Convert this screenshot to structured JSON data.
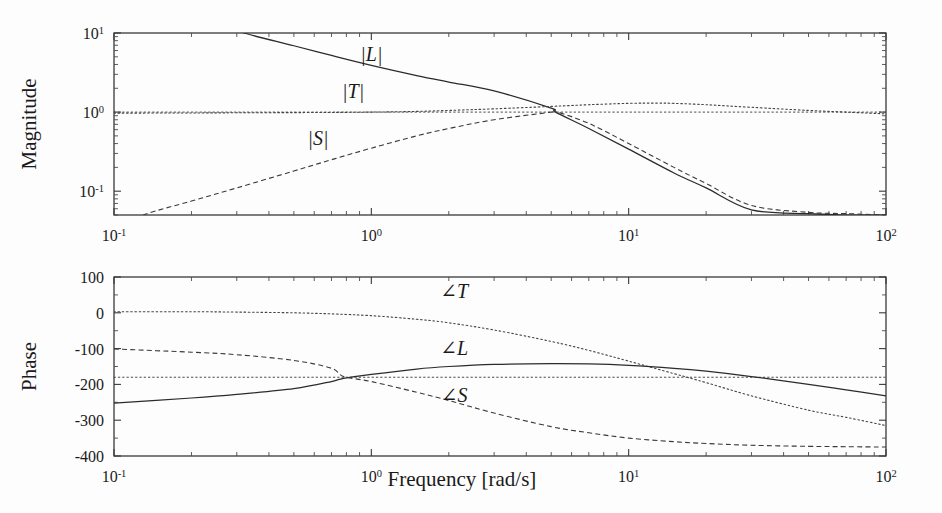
{
  "figure": {
    "type": "bode-plot",
    "background": "#fdfdfd",
    "ink_color": "#2b2b2b"
  },
  "xaxis": {
    "label": "Frequency [rad/s]",
    "scale": "log",
    "min": 0.1,
    "max": 100,
    "tick_values": [
      0.1,
      1,
      10,
      100
    ],
    "tick_labels": [
      "10",
      "10",
      "10",
      "10"
    ],
    "tick_exponents": [
      "-1",
      "0",
      "1",
      "2"
    ]
  },
  "magnitude_plot": {
    "ylabel": "Magnitude",
    "yscale": "log",
    "ymin": 0.05,
    "ymax": 10,
    "ytick_labels": [
      "10",
      "10",
      "10"
    ],
    "ytick_exponents": [
      "1",
      "0",
      "-1"
    ],
    "ytick_values": [
      10,
      1,
      0.1
    ],
    "curve_labels": [
      {
        "id": "L",
        "text": "|L|",
        "x": 1.0,
        "y": 4.4
      },
      {
        "id": "T",
        "text": "|T|",
        "x": 0.85,
        "y": 1.5
      },
      {
        "id": "S",
        "text": "|S|",
        "x": 0.62,
        "y": 0.38
      }
    ],
    "reference_line": {
      "value": 1.0,
      "style": "dotted"
    }
  },
  "phase_plot": {
    "ylabel": "Phase",
    "yscale": "linear",
    "ymin": -400,
    "ymax": 100,
    "ytick_values": [
      100,
      0,
      -100,
      -200,
      -300,
      -400
    ],
    "ytick_labels": [
      "100",
      "0",
      "-100",
      "-200",
      "-300",
      "-400"
    ],
    "curve_labels": [
      {
        "id": "T",
        "text": "∠T",
        "x": 2.1,
        "y": 42
      },
      {
        "id": "L",
        "text": "∠L",
        "x": 2.1,
        "y": -118
      },
      {
        "id": "S",
        "text": "∠S",
        "x": 2.1,
        "y": -248
      }
    ],
    "reference_line": {
      "value": -180,
      "style": "dotted"
    }
  },
  "chart_data": {
    "type": "line",
    "title": "",
    "subtitle": "",
    "xlabel": "Frequency [rad/s]",
    "xscale": "log",
    "xlim": [
      0.1,
      100
    ],
    "xticks": [
      0.1,
      1,
      10,
      100
    ],
    "xticklabels": [
      "10^-1",
      "10^0",
      "10^1",
      "10^2"
    ],
    "grid": false,
    "legend": "inline-annotations",
    "panels": [
      {
        "name": "magnitude",
        "ylabel": "Magnitude",
        "yscale": "log",
        "ylim": [
          0.05,
          10
        ],
        "yticks": [
          10,
          1,
          0.1
        ],
        "yticklabels": [
          "10^1",
          "10^0",
          "10^-1"
        ],
        "annotations": [
          "|L|",
          "|T|",
          "|S|"
        ],
        "reference_lines": [
          {
            "y": 1.0,
            "style": "dotted"
          }
        ],
        "series": [
          {
            "name": "|L|",
            "style": "solid",
            "x": [
              0.1,
              0.15,
              0.2,
              0.3,
              0.32,
              0.5,
              0.7,
              1.0,
              1.5,
              2.0,
              3.0,
              5.0,
              5.2,
              7.0,
              10.0,
              15.0,
              20.0,
              30.0,
              50.0,
              70.0,
              100.0
            ],
            "y": [
              32.0,
              22.0,
              17.0,
              11.5,
              10.0,
              6.9,
              5.2,
              3.9,
              2.9,
              2.4,
              1.85,
              1.12,
              1.0,
              0.62,
              0.34,
              0.17,
              0.11,
              0.058,
              0.052,
              0.05,
              0.05
            ]
          },
          {
            "name": "|T|",
            "style": "dotted",
            "x": [
              0.1,
              0.2,
              0.3,
              0.5,
              0.7,
              1.0,
              1.5,
              2.0,
              3.0,
              5.0,
              7.0,
              10.0,
              13.0,
              15.0,
              20.0,
              30.0,
              50.0,
              70.0,
              100.0
            ],
            "y": [
              0.97,
              0.975,
              0.98,
              0.985,
              0.99,
              1.0,
              1.02,
              1.05,
              1.1,
              1.18,
              1.24,
              1.29,
              1.3,
              1.29,
              1.24,
              1.15,
              1.05,
              1.0,
              0.95
            ]
          },
          {
            "name": "|S|",
            "style": "dashed",
            "x": [
              0.1,
              0.13,
              0.2,
              0.3,
              0.5,
              0.7,
              1.0,
              1.5,
              2.0,
              3.0,
              5.0,
              5.2,
              7.0,
              10.0,
              15.0,
              20.0,
              30.0,
              50.0,
              70.0,
              100.0
            ],
            "y": [
              0.032,
              0.05,
              0.075,
              0.11,
              0.18,
              0.25,
              0.35,
              0.5,
              0.62,
              0.8,
              1.0,
              1.02,
              0.72,
              0.4,
              0.2,
              0.125,
              0.066,
              0.054,
              0.052,
              0.05
            ]
          }
        ]
      },
      {
        "name": "phase",
        "ylabel": "Phase",
        "yscale": "linear",
        "ylim": [
          -400,
          100
        ],
        "yticks": [
          100,
          0,
          -100,
          -200,
          -300,
          -400
        ],
        "yticklabels": [
          "100",
          "0",
          "-100",
          "-200",
          "-300",
          "-400"
        ],
        "annotations": [
          "∠T",
          "∠L",
          "∠S"
        ],
        "reference_lines": [
          {
            "y": -180,
            "style": "dotted"
          }
        ],
        "series": [
          {
            "name": "∠T",
            "style": "dotted",
            "x": [
              0.1,
              0.2,
              0.3,
              0.5,
              0.7,
              1.0,
              1.5,
              2.0,
              3.0,
              5.0,
              7.0,
              10.0,
              15.0,
              20.0,
              30.0,
              50.0,
              70.0,
              100.0
            ],
            "y": [
              3,
              3,
              2,
              0,
              -3,
              -8,
              -18,
              -28,
              -48,
              -80,
              -105,
              -135,
              -170,
              -195,
              -232,
              -272,
              -292,
              -315
            ]
          },
          {
            "name": "∠L",
            "style": "solid",
            "x": [
              0.1,
              0.2,
              0.3,
              0.5,
              0.7,
              0.78,
              1.0,
              1.5,
              2.0,
              3.0,
              5.0,
              7.0,
              10.0,
              15.0,
              20.0,
              30.0,
              50.0,
              70.0,
              100.0
            ],
            "y": [
              -252,
              -238,
              -228,
              -212,
              -192,
              -183,
              -172,
              -157,
              -150,
              -144,
              -142,
              -143,
              -147,
              -155,
              -163,
              -178,
              -200,
              -215,
              -232
            ]
          },
          {
            "name": "∠S",
            "style": "dashed",
            "x": [
              0.1,
              0.2,
              0.3,
              0.5,
              0.7,
              0.78,
              1.0,
              1.5,
              2.0,
              3.0,
              5.0,
              7.0,
              10.0,
              15.0,
              20.0,
              30.0,
              50.0,
              70.0,
              100.0
            ],
            "y": [
              -101,
              -110,
              -117,
              -133,
              -155,
              -178,
              -192,
              -222,
              -245,
              -280,
              -318,
              -335,
              -350,
              -360,
              -365,
              -370,
              -373,
              -374,
              -375
            ]
          }
        ]
      }
    ]
  }
}
